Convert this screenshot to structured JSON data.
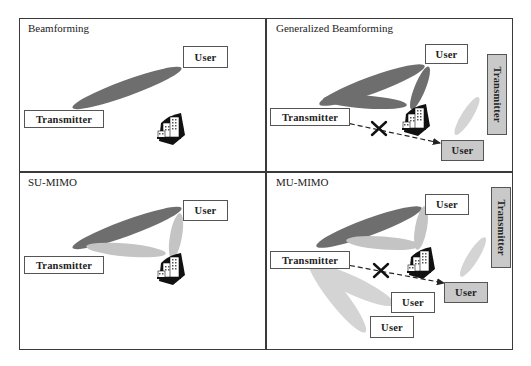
{
  "figure": {
    "panels": [
      {
        "id": "beamforming",
        "title": "Beamforming",
        "labels": {
          "user": "User",
          "transmitter": "Transmitter"
        }
      },
      {
        "id": "generalized-beamforming",
        "title": "Generalized Beamforming",
        "labels": {
          "user": "User",
          "transmitter": "Transmitter",
          "interfering_transmitter": "Transmitter",
          "interfered_user": "User"
        }
      },
      {
        "id": "su-mimo",
        "title": "SU-MIMO",
        "labels": {
          "user": "User",
          "transmitter": "Transmitter"
        }
      },
      {
        "id": "mu-mimo",
        "title": "MU-MIMO",
        "labels": {
          "user_1": "User",
          "transmitter": "Transmitter",
          "interfering_transmitter": "Transmitter",
          "interfered_user": "User",
          "user_2": "User",
          "user_3": "User"
        }
      }
    ],
    "colors": {
      "dark_beam": "#6e6e6e",
      "light_beam": "#c4c4c4",
      "faint_beam": "#d4d4d4",
      "gray_box": "#c9c9c9",
      "border": "#3a3a3a"
    },
    "icons": [
      "building-obstacle-icon",
      "blocked-x-icon",
      "dashed-arrow-icon"
    ]
  }
}
